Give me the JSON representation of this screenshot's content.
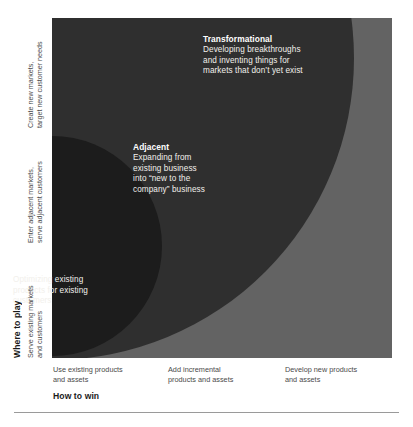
{
  "chart_data": {
    "type": "other",
    "title": "",
    "subtitle": "",
    "xlabel": "How to win",
    "ylabel": "Where to play",
    "grid": false,
    "legend_position": "none",
    "x_tick_labels": [
      "Use existing products and assets",
      "Add incremental products and assets",
      "Develop new products and assets"
    ],
    "y_tick_labels": [
      "Serve existing markets and customers",
      "Enter adjacent markets, serve adjacent customers",
      "Create new markets, target new customer needs"
    ],
    "zones": [
      {
        "name": "Core",
        "title": "Core",
        "body": "Optimizing existing\nproducts for existing\ncustomers",
        "color": "#1c1c1c",
        "radius_fraction": 0.32,
        "origin": "bottom-left",
        "x_band": "Use existing products and assets",
        "y_band": "Serve existing markets and customers"
      },
      {
        "name": "Adjacent",
        "title": "Adjacent",
        "body": "Expanding from\nexisting business\ninto “new to the\ncompany” business",
        "color": "#2f2f2f",
        "radius_fraction": 0.89,
        "origin": "bottom-left",
        "x_band": "Add incremental products and assets",
        "y_band": "Enter adjacent markets, serve adjacent customers"
      },
      {
        "name": "Transformational",
        "title": "Transformational",
        "body": "Developing breakthroughs\nand inventing things for\nmarkets that don’t yet exist",
        "color": "#636363",
        "radius_fraction": 1.0,
        "origin": "bottom-left",
        "x_band": "Develop new products and assets",
        "y_band": "Create new markets, target new customer needs"
      }
    ]
  },
  "figure": {
    "plot_background": "#636363",
    "label_text_color": "#f2f0ec",
    "axis_text_color": "#4a4a4a",
    "axis_title_color": "#1a1a1a",
    "rule_color": "#9a9a9a"
  },
  "zone_labels": {
    "transformational": {
      "title": "Transformational",
      "body": "Developing breakthroughs\nand inventing things for\nmarkets that don’t yet exist"
    },
    "adjacent": {
      "title": "Adjacent",
      "body": "Expanding from\nexisting business\ninto “new to the\ncompany” business"
    },
    "core": {
      "title": "Core",
      "body": "Optimizing existing\nproducts for existing\ncustomers"
    }
  },
  "vertical_axis": {
    "title": "Where to play",
    "bands": [
      "Create new markets,\ntarget new customer needs",
      "Enter adjacent markets,\nserve adjacent customers",
      "Serve existing markets\nand customers"
    ]
  },
  "horizontal_axis": {
    "title": "How to win",
    "bands": [
      "Use existing products\nand assets",
      "Add incremental\nproducts and assets",
      "Develop new products\nand assets"
    ]
  }
}
